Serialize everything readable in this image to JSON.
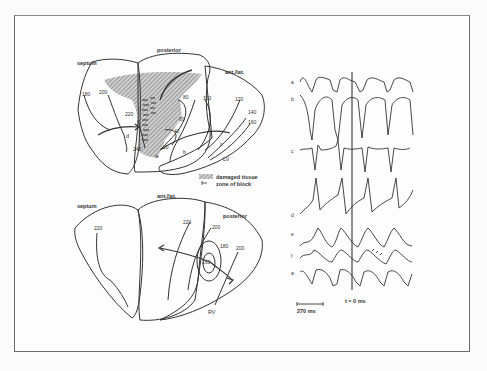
{
  "figure": {
    "top_map": {
      "region_labels": {
        "septum": "septum",
        "posterior": "posterior",
        "ant_lat": "ant./lat.",
        "chamber": "LV"
      },
      "isochrones": [
        "180",
        "200",
        "220",
        "240",
        "100",
        "80",
        "60",
        "40",
        "20",
        "120",
        "140",
        "160"
      ],
      "site_labels": {
        "a": "a",
        "b": "b",
        "c": "c",
        "d": "d"
      }
    },
    "legend": {
      "damaged": "damaged tissue",
      "block": "zone of block"
    },
    "bottom_map": {
      "region_labels": {
        "septum": "septum",
        "ant_lat": "ant./lat.",
        "posterior": "posterior",
        "chamber": "RV"
      },
      "isochrones": [
        "220",
        "220",
        "200",
        "180",
        "200",
        "160"
      ]
    },
    "traces": {
      "labels": [
        "a",
        "b",
        "c",
        "d",
        "e",
        "f",
        "a"
      ],
      "time_marker": "t = 0 ms",
      "scale_bar": "270 ms"
    }
  }
}
